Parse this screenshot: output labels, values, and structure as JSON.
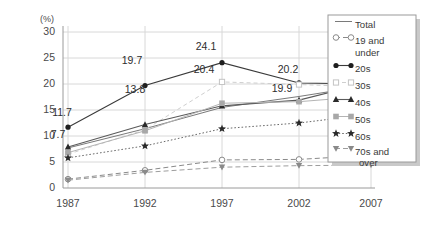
{
  "chart_data": {
    "type": "line",
    "title": "",
    "xlabel": "",
    "ylabel": "(%)",
    "categories": [
      "1987",
      "1992",
      "1997",
      "2002",
      "2007"
    ],
    "ylim": [
      0,
      30
    ],
    "yticks": [
      0,
      5,
      10,
      15,
      20,
      25,
      30
    ],
    "grid": true,
    "legend_position": "right",
    "series": [
      {
        "name": "Total",
        "marker": "none",
        "values": [
          7.7,
          11.4,
          15.5,
          17.6,
          19.8
        ]
      },
      {
        "name": "19 and under",
        "marker": "open-circle",
        "values": [
          1.7,
          3.4,
          5.4,
          5.5,
          6.3
        ]
      },
      {
        "name": "20s",
        "marker": "filled-circle",
        "values": [
          11.7,
          19.7,
          24.1,
          20.2,
          20.0
        ]
      },
      {
        "name": "30s",
        "marker": "open-square",
        "values": [
          6.5,
          11.2,
          20.4,
          19.9,
          19.4
        ]
      },
      {
        "name": "40s",
        "marker": "triangle-up",
        "values": [
          7.9,
          12.2,
          15.8,
          16.9,
          20.4
        ]
      },
      {
        "name": "50s",
        "marker": "gray-square",
        "values": [
          6.8,
          11.0,
          16.3,
          16.6,
          17.7
        ]
      },
      {
        "name": "60s",
        "marker": "star",
        "values": [
          5.8,
          8.1,
          11.4,
          12.5,
          14.2
        ]
      },
      {
        "name": "70s and over",
        "marker": "triangle-down",
        "values": [
          1.5,
          3.0,
          4.0,
          4.3,
          4.4
        ]
      }
    ],
    "annotations": [
      {
        "text": "11.7",
        "series": "20s",
        "x": "1987"
      },
      {
        "text": "7.7",
        "series": "Total",
        "x": "1987"
      },
      {
        "text": "19.7",
        "series": "20s",
        "x": "1992"
      },
      {
        "text": "13.8",
        "series": "40s",
        "x": "1992"
      },
      {
        "text": "24.1",
        "series": "20s",
        "x": "1997"
      },
      {
        "text": "20.4",
        "series": "30s",
        "x": "1997"
      },
      {
        "text": "20.2",
        "series": "20s",
        "x": "2002"
      },
      {
        "text": "19.9",
        "series": "Total",
        "x": "2002"
      },
      {
        "text": "20.0",
        "series": "20s",
        "x": "2007"
      },
      {
        "text": "19.4",
        "series": "50s",
        "x": "2007"
      }
    ]
  },
  "axis": {
    "unit_label": "(%)",
    "y_tick_0": "0",
    "y_tick_1": "5",
    "y_tick_2": "10",
    "y_tick_3": "15",
    "y_tick_4": "20",
    "y_tick_5": "25",
    "y_tick_6": "30",
    "x_tick_0": "1987",
    "x_tick_1": "1992",
    "x_tick_2": "1997",
    "x_tick_3": "2002",
    "x_tick_4": "2007"
  },
  "legend": {
    "items": [
      {
        "label": "Total"
      },
      {
        "label": "19 and"
      },
      {
        "label": "under"
      },
      {
        "label": "20s"
      },
      {
        "label": "30s"
      },
      {
        "label": "40s"
      },
      {
        "label": "50s"
      },
      {
        "label": "60s"
      },
      {
        "label": "70s and"
      },
      {
        "label": "over"
      }
    ]
  },
  "labels": {
    "l_11_7": "11.7",
    "l_7_7": "7.7",
    "l_19_7": "19.7",
    "l_13_8": "13.8",
    "l_24_1": "24.1",
    "l_20_4": "20.4",
    "l_20_2": "20.2",
    "l_19_9": "19.9",
    "l_20_0": "20.0",
    "l_19_4": "19.4"
  },
  "colors": {
    "grid": "#d8d8d8",
    "axis": "#9a9a9a",
    "dark": "#2e2e2e",
    "mid": "#6d6d6d",
    "light": "#bdbdbd",
    "background": "#ffffff"
  }
}
